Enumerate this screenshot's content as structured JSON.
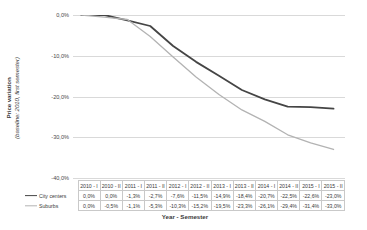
{
  "chart_data": {
    "type": "line",
    "title": "",
    "xlabel": "Year - Semester",
    "ylabel_bold": "Price variation",
    "ylabel_italic": "(baseline: 2010, first semester)",
    "categories": [
      "2010 - I",
      "2010 - II",
      "2011 - I",
      "2011 - II",
      "2012 - I",
      "2012 - II",
      "2013 - I",
      "2013 - II",
      "2014 - I",
      "2014 - II",
      "2015 - I",
      "2015 - II"
    ],
    "ylim": [
      -40.0,
      0.0
    ],
    "ytick_labels": [
      "0,0%",
      "-10,0%",
      "-20,0%",
      "-30,0%",
      "-40,0%"
    ],
    "ytick_values": [
      0.0,
      -10.0,
      -20.0,
      -30.0,
      -40.0
    ],
    "grid": true,
    "legend_position": "table-left",
    "series": [
      {
        "name": "City centers",
        "color": "#454545",
        "values": [
          0.0,
          0.0,
          -1.3,
          -2.7,
          -7.6,
          -11.5,
          -14.9,
          -18.4,
          -20.7,
          -22.5,
          -22.6,
          -23.0
        ],
        "labels": [
          "0,0%",
          "0,0%",
          "-1,3%",
          "-2,7%",
          "-7,6%",
          "-11,5%",
          "-14,9%",
          "-18,4%",
          "-20,7%",
          "-22,5%",
          "-22,6%",
          "-23,0%"
        ]
      },
      {
        "name": "Suburbs",
        "color": "#b3b3b3",
        "values": [
          0.0,
          -0.5,
          -1.1,
          -5.3,
          -10.3,
          -15.2,
          -19.5,
          -23.3,
          -26.1,
          -29.4,
          -31.4,
          -33.0
        ],
        "labels": [
          "0,0%",
          "-0,5%",
          "-1,1%",
          "-5,3%",
          "-10,3%",
          "-15,2%",
          "-19,5%",
          "-23,3%",
          "-26,1%",
          "-29,4%",
          "-31,4%",
          "-33,0%"
        ]
      }
    ]
  }
}
